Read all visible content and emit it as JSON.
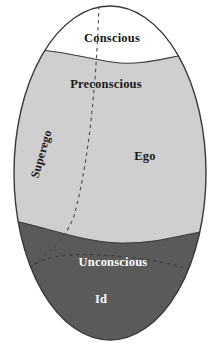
{
  "diagram": {
    "shape": "ellipse",
    "background_color": "#ffffff",
    "outline_color": "#3a3a3a",
    "regions": [
      {
        "id": "conscious",
        "label": "Conscious",
        "fill": "#ffffff",
        "text_color": "#1a1a1a",
        "label_x": 112,
        "label_y": 42
      },
      {
        "id": "preconscious",
        "label": "Preconscious",
        "fill": "#cfcfcf",
        "text_color": "#1a1a1a",
        "label_x": 106,
        "label_y": 88
      },
      {
        "id": "unconscious",
        "label": "Unconscious",
        "fill": "#5a5a5a",
        "text_color": "#ffffff",
        "label_x": 113,
        "label_y": 262
      }
    ],
    "structures": [
      {
        "id": "superego",
        "label": "Superego",
        "text_color": "#1a1a1a",
        "label_x": 45,
        "label_y": 155,
        "rotation": -74
      },
      {
        "id": "ego",
        "label": "Ego",
        "text_color": "#1a1a1a",
        "label_x": 145,
        "label_y": 155,
        "rotation": 0
      },
      {
        "id": "id",
        "label": "Id",
        "text_color": "#ffffff",
        "label_x": 101,
        "label_y": 299,
        "rotation": 0
      }
    ],
    "dividers": [
      {
        "id": "superego-ego-divider",
        "style": "dashed",
        "color": "#4a4a4a"
      },
      {
        "id": "ego-id-divider",
        "style": "dashed",
        "color": "#3a3a3a"
      }
    ],
    "colors": {
      "light_gray": "#cfcfcf",
      "dark_gray": "#5a5a5a",
      "white": "#ffffff",
      "outline": "#3a3a3a",
      "dash": "#4a4a4a"
    }
  }
}
